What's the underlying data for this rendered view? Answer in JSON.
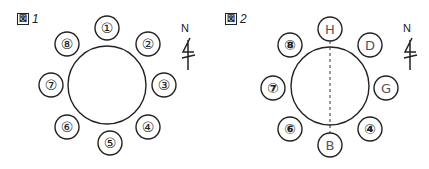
{
  "figures": [
    {
      "id": "fig1",
      "label_mark": "図",
      "label_number": "1",
      "center": [
        107,
        85
      ],
      "table_radius": 39,
      "seat_radius": 12,
      "divider": false,
      "north_label": "N",
      "seats": [
        {
          "label": "①",
          "x": 107,
          "y": 28,
          "style": "double"
        },
        {
          "label": "②",
          "x": 148,
          "y": 44,
          "style": "double"
        },
        {
          "label": "③",
          "x": 164,
          "y": 85,
          "style": "double"
        },
        {
          "label": "④",
          "x": 148,
          "y": 127,
          "style": "double"
        },
        {
          "label": "⑤",
          "x": 110,
          "y": 143,
          "style": "double"
        },
        {
          "label": "⑥",
          "x": 67,
          "y": 127,
          "style": "double"
        },
        {
          "label": "⑦",
          "x": 51,
          "y": 85,
          "style": "double"
        },
        {
          "label": "⑧",
          "x": 67,
          "y": 44,
          "style": "double"
        }
      ]
    },
    {
      "id": "fig2",
      "label_mark": "図",
      "label_number": "2",
      "center": [
        115,
        86
      ],
      "table_radius": 39,
      "seat_radius": 12,
      "divider": true,
      "north_label": "N",
      "seats": [
        {
          "label": "H",
          "x": 115,
          "y": 29,
          "style": "single"
        },
        {
          "label": "D",
          "x": 155,
          "y": 45,
          "style": "single"
        },
        {
          "label": "G",
          "x": 171,
          "y": 88,
          "style": "single"
        },
        {
          "label": "④",
          "x": 155,
          "y": 129,
          "style": "double"
        },
        {
          "label": "B",
          "x": 115,
          "y": 145,
          "style": "single"
        },
        {
          "label": "⑥",
          "x": 75,
          "y": 129,
          "style": "double"
        },
        {
          "label": "⑦",
          "x": 58,
          "y": 88,
          "style": "double"
        },
        {
          "label": "⑧",
          "x": 75,
          "y": 45,
          "style": "double"
        }
      ]
    }
  ]
}
